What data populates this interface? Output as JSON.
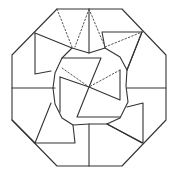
{
  "diagram": {
    "title": "",
    "colors": {
      "line": "#333333",
      "dotted": "#555555",
      "background": "#ffffff"
    },
    "octagon": [
      [
        57,
        9
      ],
      [
        122,
        9
      ],
      [
        166,
        55
      ],
      [
        166,
        120
      ],
      [
        122,
        166
      ],
      [
        57,
        166
      ],
      [
        12,
        120
      ],
      [
        12,
        55
      ]
    ],
    "solid_polylines": [
      [
        [
          12,
          88
        ],
        [
          55,
          88
        ]
      ],
      [
        [
          127,
          88
        ],
        [
          166,
          88
        ]
      ],
      [
        [
          89,
          9
        ],
        [
          89,
          53
        ]
      ],
      [
        [
          89,
          124
        ],
        [
          89,
          166
        ]
      ],
      [
        [
          35,
          33
        ],
        [
          72,
          48
        ],
        [
          89,
          53
        ],
        [
          105,
          48
        ],
        [
          102,
          32
        ],
        [
          142,
          32
        ]
      ],
      [
        [
          142,
          32
        ],
        [
          127,
          70
        ],
        [
          126,
          86
        ],
        [
          128,
          102
        ],
        [
          120,
          118
        ],
        [
          107,
          124
        ],
        [
          89,
          124
        ],
        [
          73,
          125
        ],
        [
          62,
          118
        ],
        [
          55,
          104
        ],
        [
          53,
          88
        ],
        [
          55,
          73
        ],
        [
          62,
          58
        ],
        [
          72,
          48
        ]
      ],
      [
        [
          35,
          33
        ],
        [
          35,
          74
        ],
        [
          51,
          71
        ]
      ],
      [
        [
          105,
          48
        ],
        [
          120,
          57
        ],
        [
          127,
          70
        ]
      ],
      [
        [
          142,
          32
        ],
        [
          127,
          70
        ]
      ],
      [
        [
          127,
          107
        ],
        [
          143,
          103
        ],
        [
          143,
          143
        ],
        [
          107,
          124
        ]
      ],
      [
        [
          35,
          143
        ],
        [
          51,
          103
        ]
      ],
      [
        [
          35,
          143
        ],
        [
          75,
          143
        ],
        [
          73,
          125
        ]
      ],
      [
        [
          62,
          58
        ],
        [
          101,
          58
        ],
        [
          89,
          87
        ]
      ],
      [
        [
          60,
          77
        ],
        [
          89,
          87
        ],
        [
          120,
          100
        ],
        [
          120,
          70
        ]
      ],
      [
        [
          60,
          77
        ],
        [
          60,
          112
        ]
      ],
      [
        [
          89,
          87
        ],
        [
          77,
          117
        ],
        [
          120,
          117
        ]
      ],
      [
        [
          142,
          143
        ],
        [
          107,
          124
        ]
      ],
      [
        [
          35,
          143
        ],
        [
          12,
          120
        ]
      ]
    ],
    "dotted_polylines": [
      [
        [
          57,
          9
        ],
        [
          72,
          47
        ]
      ],
      [
        [
          89,
          9
        ],
        [
          75,
          47
        ]
      ],
      [
        [
          89,
          9
        ],
        [
          105,
          47
        ]
      ],
      [
        [
          105,
          47
        ],
        [
          142,
          32
        ]
      ],
      [
        [
          62,
          68
        ],
        [
          89,
          87
        ]
      ],
      [
        [
          120,
          70
        ],
        [
          89,
          87
        ]
      ]
    ]
  }
}
